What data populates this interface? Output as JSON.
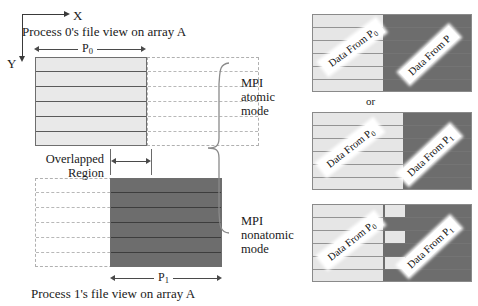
{
  "figure": {
    "axes": {
      "x_label": "X",
      "y_label": "Y"
    },
    "top_caption": "Process 0's file view on array A",
    "bottom_caption": "Process 1's file view on array A",
    "top_dim_label": "P",
    "top_dim_sub": "0",
    "bottom_dim_label": "P",
    "bottom_dim_sub": "1",
    "overlap_label_line1": "Overlapped",
    "overlap_label_line2": "Region",
    "modes": [
      {
        "line1": "MPI",
        "line2": "atomic",
        "line3": "mode"
      },
      {
        "line1": "MPI",
        "line2": "nonatomic",
        "line3": "mode"
      }
    ],
    "or_text": "or",
    "panels": [
      {
        "name": "atomic-result-a",
        "left_tag": "Data From P",
        "left_tag_sub": "0",
        "right_tag": "Data From P",
        "right_tag_sub": "",
        "boundary": "straight"
      },
      {
        "name": "atomic-result-b",
        "left_tag": "Data From P",
        "left_tag_sub": "0",
        "right_tag": "Data From P",
        "right_tag_sub": "1",
        "boundary": "straight"
      },
      {
        "name": "nonatomic-result",
        "left_tag": "Data From P",
        "left_tag_sub": "0",
        "right_tag": "Data From P",
        "right_tag_sub": "1",
        "boundary": "interleaved"
      }
    ],
    "colors": {
      "process0_fill": "#e6e6e6",
      "process1_fill": "#6d6d6d",
      "dashed_outline": "#b0b0b0",
      "solid_outline": "#6e6e6e",
      "text": "#1a1a1a"
    }
  }
}
